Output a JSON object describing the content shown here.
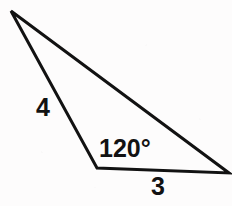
{
  "figure": {
    "type": "geometry-diagram",
    "shape": "triangle",
    "background_color": "#fdfcfc",
    "stroke_color": "#121212",
    "stroke_width": 3,
    "canvas": {
      "width": 232,
      "height": 206
    }
  },
  "vertices": {
    "apex": {
      "name": "apex-vertex",
      "x": 11,
      "y": 11
    },
    "bottom_left": {
      "name": "angle-vertex",
      "x": 97,
      "y": 168
    },
    "right": {
      "name": "right-vertex",
      "x": 229,
      "y": 173
    }
  },
  "labels": {
    "side_a": "4",
    "angle": "120°",
    "side_b": "3"
  },
  "chart_data": {
    "type": "diagram",
    "title": "",
    "shape": "triangle",
    "points": [
      {
        "id": "A",
        "x": 11,
        "y": 11,
        "role": "apex"
      },
      {
        "id": "B",
        "x": 97,
        "y": 168,
        "role": "labeled-angle"
      },
      {
        "id": "C",
        "x": 229,
        "y": 173,
        "role": "right"
      }
    ],
    "edges": [
      {
        "from": "A",
        "to": "B",
        "label": "4"
      },
      {
        "from": "B",
        "to": "C",
        "label": "3"
      },
      {
        "from": "C",
        "to": "A",
        "label": ""
      }
    ],
    "angles": [
      {
        "at": "B",
        "label": "120°",
        "value": 120,
        "unit": "degrees"
      }
    ]
  }
}
